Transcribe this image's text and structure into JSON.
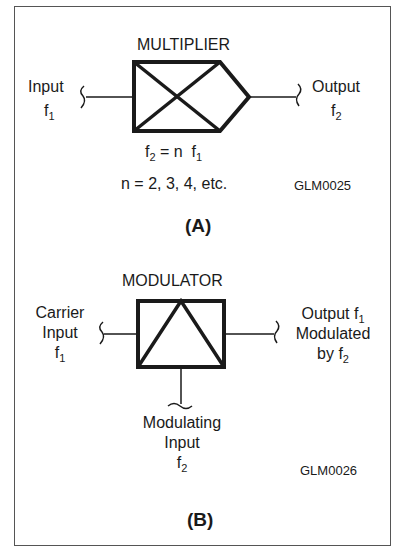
{
  "figure_a": {
    "title": "MULTIPLIER",
    "input_label": "Input",
    "input_var": "f",
    "input_sub": "1",
    "output_label": "Output",
    "output_var": "f",
    "output_sub": "2",
    "equation_lhs": "f",
    "equation_lhs_sub": "2",
    "equation_mid": " = n  f",
    "equation_rhs_sub": "1",
    "n_values": "n = 2, 3, 4, etc.",
    "code": "GLM0025",
    "caption": "(A)"
  },
  "figure_b": {
    "title": "MODULATOR",
    "carrier_line1": "Carrier",
    "carrier_line2": "Input",
    "carrier_var": "f",
    "carrier_sub": "1",
    "output_line1": "Output f",
    "output_line1_sub": "1",
    "output_line2": "Modulated",
    "output_line3": "by f",
    "output_line3_sub": "2",
    "modulating_line1": "Modulating",
    "modulating_line2": "Input",
    "modulating_var": "f",
    "modulating_sub": "2",
    "code": "GLM0026",
    "caption": "(B)"
  }
}
